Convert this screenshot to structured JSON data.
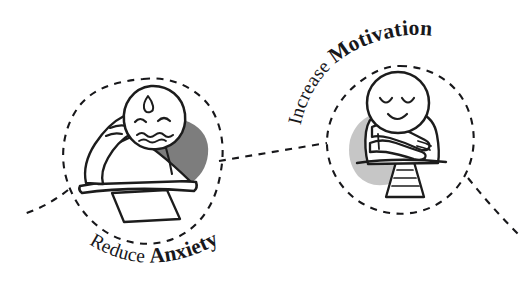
{
  "illustration": {
    "title": "Reduce Anxiety and Increase Motivation concept sketch",
    "style": "hand-drawn doodle, black ink on white",
    "background_color": "#ffffff",
    "ink_color": "#1c1c1c"
  },
  "nodes": [
    {
      "id": "reduce-anxiety",
      "label_light": "Reduce ",
      "label_bold": "Anxiety",
      "label_full": "Reduce Anxiety",
      "label_position": "below-circle-arc",
      "blob_color": "#7d7d7d",
      "figure": {
        "name": "anxious-person-at-desk",
        "expression": "worried",
        "features": [
          "sweat-drop",
          "worried-eyes",
          "wavy-mouth",
          "hand-on-cheek",
          "desk",
          "paper-sheet"
        ]
      }
    },
    {
      "id": "increase-motivation",
      "label_light": "Increase ",
      "label_bold": "Motivation",
      "label_full": "Increase Motivation",
      "label_position": "above-circle-arc",
      "blob_color": "#c6c6c6",
      "figure": {
        "name": "confident-person-arms-crossed",
        "expression": "content",
        "features": [
          "closed-eyes",
          "smile",
          "crossed-arms",
          "striped-pedestal"
        ]
      }
    }
  ],
  "connectors": [
    {
      "id": "left-tail",
      "from": "off-canvas-left",
      "to": "reduce-anxiety",
      "style": "dashed"
    },
    {
      "id": "middle-link",
      "from": "reduce-anxiety",
      "to": "increase-motivation",
      "style": "dashed"
    },
    {
      "id": "right-tail",
      "from": "increase-motivation",
      "to": "off-canvas-right",
      "style": "dashed"
    }
  ]
}
